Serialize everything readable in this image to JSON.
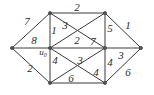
{
  "figure": {
    "type": "weighted-graph-diagram",
    "width": 154,
    "height": 95,
    "background_color": "#ffffff",
    "edge_color": "#3a3a3a",
    "label_color": "#2b2b2b",
    "node_color": "#555555"
  },
  "nodes": [
    {
      "id": "left",
      "label": "",
      "x": 12,
      "y": 48
    },
    {
      "id": "top_left",
      "label": "",
      "x": 50,
      "y": 13
    },
    {
      "id": "top_right",
      "label": "",
      "x": 105,
      "y": 13
    },
    {
      "id": "right",
      "label": "",
      "x": 141,
      "y": 48
    },
    {
      "id": "center",
      "label": "u0",
      "x": 50,
      "y": 48
    },
    {
      "id": "mid_right",
      "label": "",
      "x": 105,
      "y": 48
    },
    {
      "id": "bottom_left",
      "label": "",
      "x": 50,
      "y": 83
    },
    {
      "id": "bottom_right",
      "label": "",
      "x": 105,
      "y": 83
    }
  ],
  "node_labels": [
    {
      "name": "u-zero-label",
      "base": "u",
      "sub": "0",
      "x": 43,
      "y": 53
    }
  ],
  "edges": [
    {
      "from": "top_left",
      "to": "top_right",
      "weight": "2"
    },
    {
      "from": "left",
      "to": "top_left",
      "weight": "7"
    },
    {
      "from": "left",
      "to": "center",
      "weight": "8"
    },
    {
      "from": "left",
      "to": "bottom_left",
      "weight": "2"
    },
    {
      "from": "top_left",
      "to": "center",
      "weight": "1"
    },
    {
      "from": "top_left",
      "to": "mid_right",
      "weight": "3"
    },
    {
      "from": "top_right",
      "to": "center",
      "weight": "2"
    },
    {
      "from": "top_right",
      "to": "mid_right",
      "weight": "5"
    },
    {
      "from": "top_right",
      "to": "right",
      "weight": "1"
    },
    {
      "from": "center",
      "to": "mid_right",
      "weight": "7"
    },
    {
      "from": "center",
      "to": "bottom_left",
      "weight": "4"
    },
    {
      "from": "center",
      "to": "bottom_right",
      "weight": "3"
    },
    {
      "from": "mid_right",
      "to": "right",
      "weight": "3"
    },
    {
      "from": "mid_right",
      "to": "bottom_left",
      "weight": "4"
    },
    {
      "from": "mid_right",
      "to": "bottom_right",
      "weight": "4"
    },
    {
      "from": "bottom_left",
      "to": "bottom_right",
      "weight": "6"
    },
    {
      "from": "bottom_right",
      "to": "right",
      "weight": "6"
    }
  ],
  "edge_labels": [
    {
      "name": "edge-label-top",
      "text": "2",
      "x": 77,
      "y": 7
    },
    {
      "name": "edge-label-left-topleft",
      "text": "7",
      "x": 27,
      "y": 21
    },
    {
      "name": "edge-label-left-center",
      "text": "8",
      "x": 34,
      "y": 40
    },
    {
      "name": "edge-label-topleft-center",
      "text": "1",
      "x": 54,
      "y": 30
    },
    {
      "name": "edge-label-topleft-midright",
      "text": "3",
      "x": 65,
      "y": 25
    },
    {
      "name": "edge-label-topright-center",
      "text": "2",
      "x": 77,
      "y": 40
    },
    {
      "name": "edge-label-center-midright",
      "text": "7",
      "x": 93,
      "y": 41
    },
    {
      "name": "edge-label-topright-midright",
      "text": "5",
      "x": 110,
      "y": 28
    },
    {
      "name": "edge-label-topright-right",
      "text": "1",
      "x": 128,
      "y": 25
    },
    {
      "name": "edge-label-left-bottomleft",
      "text": "2",
      "x": 30,
      "y": 68
    },
    {
      "name": "edge-label-center-bottomleft",
      "text": "4",
      "x": 55,
      "y": 60
    },
    {
      "name": "edge-label-center-bottomright",
      "text": "3",
      "x": 80,
      "y": 60
    },
    {
      "name": "edge-label-midright-right",
      "text": "3",
      "x": 121,
      "y": 55
    },
    {
      "name": "edge-label-midright-bottomright",
      "text": "4",
      "x": 110,
      "y": 62
    },
    {
      "name": "edge-label-midright-bottomleft",
      "text": "4",
      "x": 96,
      "y": 72
    },
    {
      "name": "edge-label-bottom",
      "text": "6",
      "x": 71,
      "y": 78
    },
    {
      "name": "edge-label-bottomright-right",
      "text": "6",
      "x": 128,
      "y": 72
    }
  ]
}
